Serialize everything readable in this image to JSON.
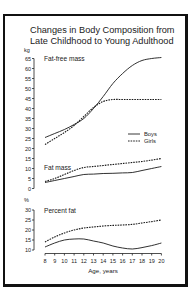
{
  "chart_data": [
    {
      "type": "line",
      "title": "Changes in Body Composition from Late Childhood to Young Adulthood",
      "panel": "Fat-free mass",
      "ylabel": "kg",
      "xlabel": "Age, years",
      "ylim": [
        0,
        65
      ],
      "x": [
        8,
        9,
        10,
        11,
        12,
        13,
        14,
        15,
        16,
        17,
        18,
        19,
        20
      ],
      "series": [
        {
          "name": "Boys",
          "style": "solid",
          "values": [
            25.5,
            27.5,
            29.5,
            32,
            35,
            40,
            46,
            52.5,
            57.5,
            61.5,
            64,
            65,
            65.5
          ]
        },
        {
          "name": "Girls",
          "style": "dashed",
          "values": [
            22,
            25,
            28,
            31.5,
            36,
            40.5,
            43.5,
            44.5,
            44.5,
            44.5,
            44.5,
            44.5,
            44.5
          ]
        }
      ],
      "legend": {
        "entries": [
          "Boys",
          "Girls"
        ],
        "position": "right"
      }
    },
    {
      "type": "line",
      "panel": "Fat mass",
      "ylabel": "kg",
      "xlabel": "Age, years",
      "ylim": [
        0,
        65
      ],
      "x": [
        8,
        9,
        10,
        11,
        12,
        13,
        14,
        15,
        16,
        17,
        18,
        19,
        20
      ],
      "series": [
        {
          "name": "Boys",
          "style": "solid",
          "values": [
            3,
            4,
            5,
            6,
            7,
            7.2,
            7.5,
            7.6,
            7.8,
            8,
            9,
            10,
            11
          ]
        },
        {
          "name": "Girls",
          "style": "dashed",
          "values": [
            3.5,
            5,
            7,
            9,
            10.5,
            11,
            11.5,
            12,
            12.5,
            13,
            13.5,
            14.2,
            15
          ]
        }
      ]
    },
    {
      "type": "line",
      "panel": "Percent fat",
      "ylabel": "%",
      "xlabel": "Age, years",
      "ylim": [
        10,
        30
      ],
      "yticks": [
        10,
        15,
        20,
        25,
        30
      ],
      "x": [
        8,
        9,
        10,
        11,
        12,
        13,
        14,
        15,
        16,
        17,
        18,
        19,
        20
      ],
      "series": [
        {
          "name": "Boys",
          "style": "solid",
          "values": [
            11.5,
            13.5,
            15,
            15.5,
            15.5,
            14.5,
            13.5,
            12,
            11,
            10.5,
            11.2,
            12.2,
            13.5
          ]
        },
        {
          "name": "Girls",
          "style": "dashed",
          "values": [
            14,
            16.5,
            18.5,
            20,
            21,
            21.5,
            22,
            22.3,
            22.5,
            22.8,
            23.5,
            24.2,
            25
          ]
        }
      ]
    }
  ],
  "title_line1": "Changes in Body Composition from",
  "title_line2": "Late Childhood to Young Adulthood",
  "kg_unit": "kg",
  "pct_unit": "%",
  "panel_fatfree": "Fat-free mass",
  "panel_fatmass": "Fat mass",
  "panel_pctfat": "Percent fat",
  "legend_boys": "Boys",
  "legend_girls": "Girls",
  "xlabel": "Age, years",
  "kg_ticks": [
    "65",
    "60",
    "55",
    "50",
    "45",
    "40",
    "35",
    "30",
    "25",
    "20",
    "15",
    "10",
    "5",
    "0"
  ],
  "pct_ticks": [
    "30",
    "25",
    "20",
    "15",
    "10"
  ],
  "x_ticks": [
    "8",
    "9",
    "10",
    "11",
    "12",
    "13",
    "14",
    "15",
    "16",
    "17",
    "18",
    "19",
    "20"
  ]
}
